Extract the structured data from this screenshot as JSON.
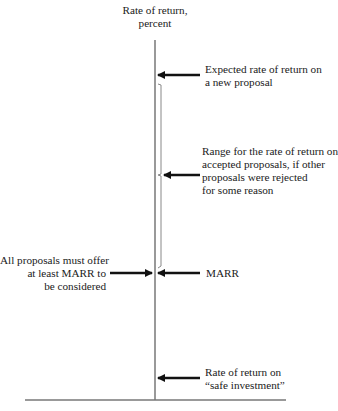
{
  "axis": {
    "title_line1": "Rate of return,",
    "title_line2": "percent"
  },
  "labels": {
    "expected": [
      "Expected rate of return on",
      "a new proposal"
    ],
    "range": [
      "Range for the rate of return on",
      "accepted proposals, if other",
      "proposals were rejected",
      "for some reason"
    ],
    "all_proposals": [
      "All proposals must offer",
      "at least MARR to",
      "be considered"
    ],
    "marr": "MARR",
    "safe": [
      "Rate of return on",
      "“safe investment”"
    ]
  },
  "colors": {
    "axis": "#777777",
    "arrow": "#111111",
    "text": "#1a1a1a"
  }
}
